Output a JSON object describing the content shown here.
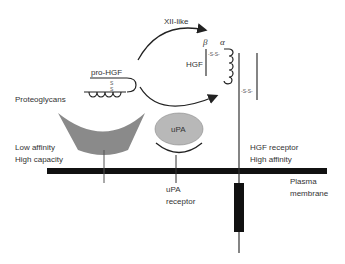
{
  "diagram": {
    "labels": {
      "xii_like": "XII-like",
      "pro_hgf": "pro-HGF",
      "proteoglycans": "Proteoglycans",
      "beta": "β",
      "alpha": "α",
      "hgf": "HGF",
      "ss_bond_top": "-S-S-",
      "ss_bond_receptor": "-S-S-",
      "ss_vertical_1": "S",
      "ss_vertical_2": "S",
      "upa": "uPA",
      "low_affinity": "Low affinity",
      "high_capacity": "High capacity",
      "hgf_receptor": "HGF receptor",
      "high_affinity": "High affinity",
      "upa_receptor_1": "uPA",
      "upa_receptor_2": "receptor",
      "plasma_1": "Plasma",
      "plasma_2": "membrane"
    },
    "colors": {
      "line": "#333333",
      "membrane": "#111111",
      "proteoglycan_fill": "#8a8a8a",
      "upa_fill": "#b8b8b8",
      "transmembrane": "#111111"
    }
  }
}
